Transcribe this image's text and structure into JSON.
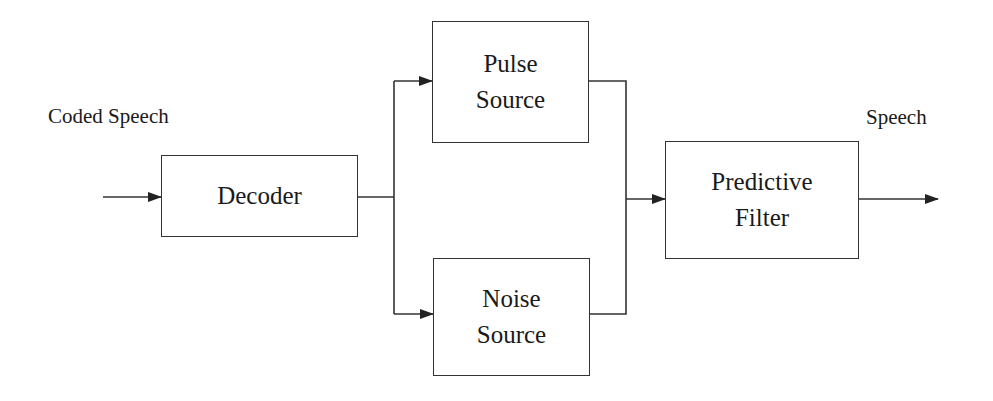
{
  "diagram": {
    "input_label": "Coded Speech",
    "output_label": "Speech",
    "blocks": {
      "decoder": {
        "line1": "Decoder"
      },
      "pulse_source": {
        "line1": "Pulse",
        "line2": "Source"
      },
      "noise_source": {
        "line1": "Noise",
        "line2": "Source"
      },
      "predictive_filter": {
        "line1": "Predictive",
        "line2": "Filter"
      }
    },
    "edges": [
      {
        "from": "input",
        "to": "decoder"
      },
      {
        "from": "decoder",
        "to": "pulse_source"
      },
      {
        "from": "decoder",
        "to": "noise_source"
      },
      {
        "from": "pulse_source",
        "to": "predictive_filter"
      },
      {
        "from": "noise_source",
        "to": "predictive_filter"
      },
      {
        "from": "predictive_filter",
        "to": "output"
      }
    ],
    "colors": {
      "stroke": "#333333",
      "background": "#ffffff"
    }
  }
}
